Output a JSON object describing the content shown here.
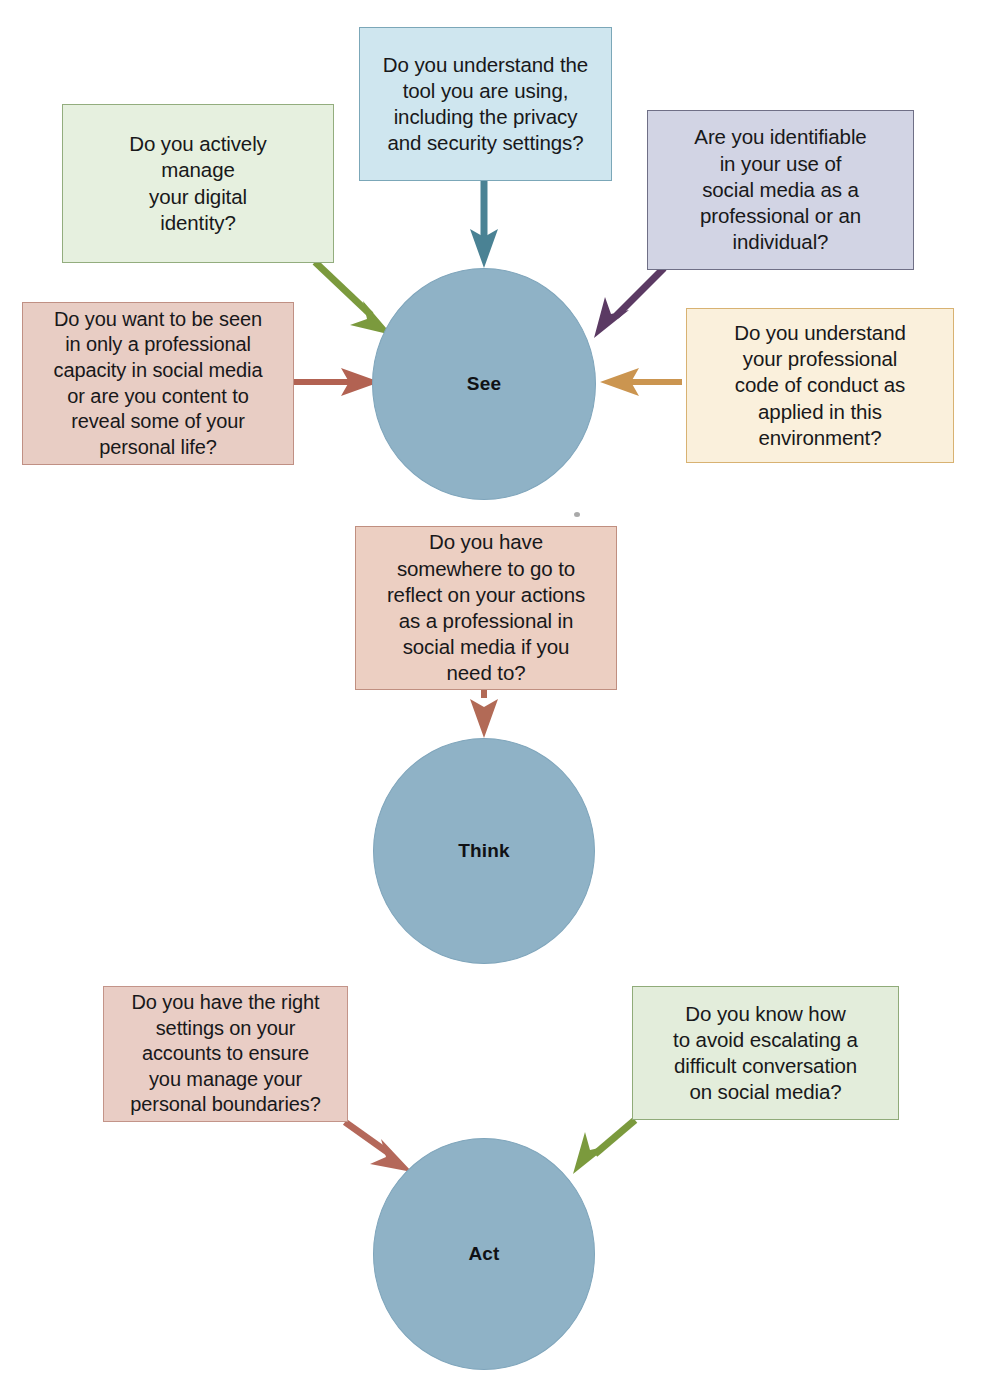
{
  "diagram": {
    "background": "#ffffff"
  },
  "nodes": [
    {
      "id": "see",
      "label": "See",
      "fill": "#8fb2c6",
      "stroke": "#7fa5bb"
    },
    {
      "id": "think",
      "label": "Think",
      "fill": "#8fb2c6",
      "stroke": "#7fa5bb"
    },
    {
      "id": "act",
      "label": "Act",
      "fill": "#8fb2c6",
      "stroke": "#7fa5bb"
    }
  ],
  "boxes": [
    {
      "id": "tool-understanding",
      "text": "Do you understand the\ntool you are using,\nincluding the privacy\nand security settings?",
      "fill": "#cfe6ef",
      "border": "#7ba7b8",
      "target": "see"
    },
    {
      "id": "digital-identity",
      "text": "Do you actively\nmanage\nyour digital\nidentity?",
      "fill": "#e6f0df",
      "border": "#93ad7e",
      "target": "see"
    },
    {
      "id": "identifiable-use",
      "text": "Are you identifiable\nin your use of\nsocial media as a\nprofessional or an\nindividual?",
      "fill": "#d2d4e4",
      "border": "#6f6f86",
      "target": "see"
    },
    {
      "id": "professional-capacity",
      "text": "Do you want to be seen\nin only a professional\ncapacity in social media\nor are you content to\nreveal some of your\npersonal life?",
      "fill": "#e8cdc4",
      "border": "#c09084",
      "target": "see"
    },
    {
      "id": "code-of-conduct",
      "text": "Do you understand\nyour professional\ncode of conduct as\napplied in this\nenvironment?",
      "fill": "#faf0dc",
      "border": "#d8b272",
      "target": "see"
    },
    {
      "id": "reflect-somewhere",
      "text": "Do you have\nsomewhere to go to\nreflect on your actions\nas a professional in\nsocial media if you\nneed to?",
      "fill": "#eccfc2",
      "border": "#c08f80",
      "target": "think"
    },
    {
      "id": "account-settings",
      "text": "Do you have the right\nsettings on your\naccounts to ensure\nyou manage your\npersonal boundaries?",
      "fill": "#e9cdc5",
      "border": "#c39489",
      "target": "act"
    },
    {
      "id": "avoid-escalating",
      "text": "Do you know how\nto avoid escalating a\ndifficult conversation\non social media?",
      "fill": "#e3eddb",
      "border": "#90ab79",
      "target": "act"
    }
  ],
  "arrows": [
    {
      "id": "tool-understanding-to-see",
      "color": "#4a8294",
      "from": "tool-understanding",
      "to": "see"
    },
    {
      "id": "digital-identity-to-see",
      "color": "#7b9a3d",
      "from": "digital-identity",
      "to": "see"
    },
    {
      "id": "identifiable-use-to-see",
      "color": "#5b3a63",
      "from": "identifiable-use",
      "to": "see"
    },
    {
      "id": "professional-capacity-to-see",
      "color": "#b26252",
      "from": "professional-capacity",
      "to": "see"
    },
    {
      "id": "code-of-conduct-to-see",
      "color": "#cb9550",
      "from": "code-of-conduct",
      "to": "see"
    },
    {
      "id": "reflect-somewhere-to-think",
      "color": "#b26a56",
      "from": "reflect-somewhere",
      "to": "think"
    },
    {
      "id": "account-settings-to-act",
      "color": "#b4685a",
      "from": "account-settings",
      "to": "act"
    },
    {
      "id": "avoid-escalating-to-act",
      "color": "#7b9a3d",
      "from": "avoid-escalating",
      "to": "act"
    }
  ]
}
